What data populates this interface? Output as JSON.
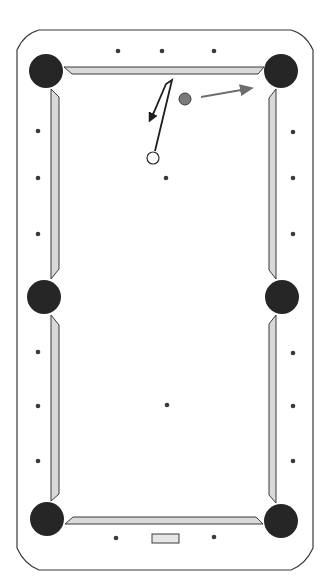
{
  "diagram": {
    "type": "pool-table-shot",
    "colors": {
      "background": "#ffffff",
      "rail_outline": "#3a3a3a",
      "cushion_fill": "#d9d9d9",
      "pocket": "#262626",
      "diamond": "#3a3a3a",
      "object_ball": "#7a7a7a",
      "cue_ball": "#ffffff",
      "cue_path": "#1e1e1e",
      "object_path": "#6e6e6e"
    },
    "table": {
      "outer": {
        "x": 17,
        "y": 30,
        "w": 296,
        "h": 540,
        "chamfer": 22
      },
      "pockets": [
        {
          "name": "top-left",
          "cx": 46,
          "cy": 71,
          "r": 17
        },
        {
          "name": "top-right",
          "cx": 281,
          "cy": 71,
          "r": 17
        },
        {
          "name": "middle-left",
          "cx": 44,
          "cy": 297,
          "r": 17
        },
        {
          "name": "middle-right",
          "cx": 282,
          "cy": 297,
          "r": 17
        },
        {
          "name": "bottom-left",
          "cx": 47,
          "cy": 519,
          "r": 17
        },
        {
          "name": "bottom-right",
          "cx": 281,
          "cy": 521,
          "r": 17
        }
      ],
      "diamonds": {
        "top": [
          [
            118,
            51
          ],
          [
            162,
            51
          ],
          [
            214,
            51
          ]
        ],
        "bottom": [
          [
            116,
            538
          ],
          [
            214,
            537
          ]
        ],
        "left": [
          [
            38,
            131
          ],
          [
            38,
            178
          ],
          [
            38,
            234
          ],
          [
            38,
            352
          ],
          [
            38,
            406
          ],
          [
            38,
            461
          ]
        ],
        "right": [
          [
            293,
            132
          ],
          [
            293,
            178
          ],
          [
            293,
            234
          ],
          [
            293,
            353
          ],
          [
            293,
            406
          ],
          [
            293,
            461
          ]
        ]
      },
      "spots": [
        [
          166,
          178
        ],
        [
          167,
          405
        ]
      ],
      "nameplate": {
        "x": 152,
        "y": 534,
        "w": 27,
        "h": 9
      }
    },
    "balls": {
      "object_ball": {
        "cx": 185,
        "cy": 99,
        "r": 6
      },
      "cue_ball": {
        "cx": 153,
        "cy": 158,
        "r": 6
      }
    },
    "paths": {
      "cue_ball_path": [
        [
          155,
          151
        ],
        [
          172,
          80
        ],
        [
          166,
          84
        ],
        [
          154,
          112
        ]
      ],
      "cue_ball_arrow_tip": [
        151,
        118
      ],
      "object_ball_path": [
        [
          201,
          97
        ],
        [
          247,
          89
        ]
      ]
    }
  }
}
